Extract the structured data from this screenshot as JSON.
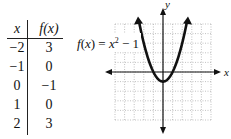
{
  "table": {
    "headers": [
      "x",
      "f(x)"
    ],
    "rows": [
      {
        "x": "−2",
        "fx": "3"
      },
      {
        "x": "−1",
        "fx": "0"
      },
      {
        "x": "0",
        "fx": "−1"
      },
      {
        "x": "1",
        "fx": "0"
      },
      {
        "x": "2",
        "fx": "3"
      }
    ]
  },
  "chart_data": {
    "type": "line",
    "title": "",
    "function_label": "f(x) = x² − 1",
    "xlabel": "x",
    "ylabel": "y",
    "xlim": [
      -5,
      5
    ],
    "ylim": [
      -5,
      5
    ],
    "grid": true,
    "series": [
      {
        "name": "f(x) = x² − 1",
        "x": [
          -2.5,
          -2,
          -1,
          0,
          1,
          2,
          2.5
        ],
        "y": [
          5.25,
          3,
          0,
          -1,
          0,
          3,
          5.25
        ]
      }
    ],
    "points": [
      {
        "x": -2,
        "y": 3
      },
      {
        "x": -1,
        "y": 0
      },
      {
        "x": 0,
        "y": -1
      },
      {
        "x": 1,
        "y": 0
      },
      {
        "x": 2,
        "y": 3
      }
    ]
  }
}
